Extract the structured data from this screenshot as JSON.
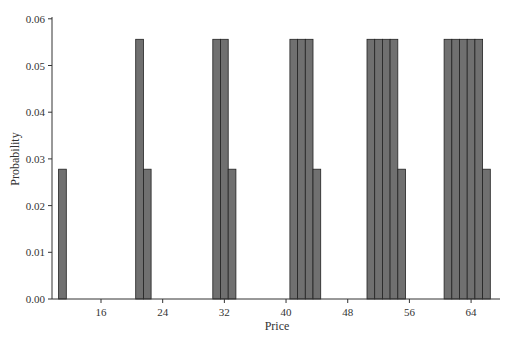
{
  "chart_data": {
    "type": "bar",
    "title": "",
    "xlabel": "Price",
    "ylabel": "Probability",
    "x": [
      11,
      21,
      22,
      31,
      32,
      33,
      41,
      42,
      43,
      44,
      51,
      52,
      53,
      54,
      55,
      61,
      62,
      63,
      64,
      65,
      66
    ],
    "values": [
      0.0278,
      0.0556,
      0.0278,
      0.0556,
      0.0556,
      0.0278,
      0.0556,
      0.0556,
      0.0556,
      0.0278,
      0.0556,
      0.0556,
      0.0556,
      0.0556,
      0.0278,
      0.0556,
      0.0556,
      0.0556,
      0.0556,
      0.0556,
      0.0278
    ],
    "xticks": [
      16,
      24,
      32,
      40,
      48,
      56,
      64
    ],
    "yticks": [
      "0.00",
      "0.01",
      "0.02",
      "0.03",
      "0.04",
      "0.05",
      "0.06"
    ],
    "ylim": [
      0,
      0.06
    ],
    "xlim": [
      10,
      67
    ],
    "grid": false,
    "legend": null,
    "bar_color": "#707070",
    "bar_edge_color": "#222222"
  }
}
